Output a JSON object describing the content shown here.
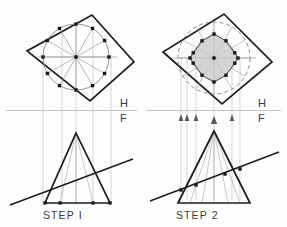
{
  "drawing": {
    "title": "Cone cut by oblique plane - two step construction",
    "background": "#fdfdfd",
    "colors": {
      "heavy_line": "#1c1c1c",
      "light_line": "#b4b4b4",
      "medium_line": "#8a8a8a",
      "fold_line": "#b9b9b9",
      "dot": "#1a1a1a",
      "shade_fill": "#c9c9c9",
      "label_text": "#3b3b3b"
    }
  },
  "panels": [
    {
      "id": "step1",
      "step_label": "STEP I",
      "step_label_pos": {
        "x": 43,
        "y": 219
      },
      "fold_labels": {
        "top": "H",
        "bottom": "F"
      },
      "fold_label_pos": {
        "h_x": 120,
        "h_y": 107,
        "f_x": 120,
        "f_y": 121
      },
      "fold_line": {
        "x1": 6,
        "y1": 110.5,
        "x2": 137,
        "y2": 110.5
      },
      "top_view": {
        "square_corners": [
          {
            "x": 92,
            "y": 15
          },
          {
            "x": 134,
            "y": 62
          },
          {
            "x": 90,
            "y": 101
          },
          {
            "x": 27,
            "y": 51
          }
        ],
        "circle_center": {
          "x": 76,
          "y": 57
        },
        "circle_radius": 33,
        "circle_style": "solid",
        "divisions": 12,
        "start_angle_deg": -90,
        "spokes_visible": true,
        "point_markers": 12,
        "marker_size": 3.4,
        "shaded": false
      },
      "front_view": {
        "apex": {
          "x": 76,
          "y": 133
        },
        "base_left": {
          "x": 45,
          "y": 203
        },
        "base_right": {
          "x": 110,
          "y": 203
        },
        "base_dots_x": [
          45,
          60,
          93,
          110
        ],
        "base_dot_y": 203,
        "element_lines": 6,
        "cut_line": {
          "x1": 10,
          "y1": 205,
          "x2": 133,
          "y2": 159
        },
        "cut_points": []
      },
      "projectors": {
        "from_top_x": [
          43,
          62,
          93,
          111
        ],
        "y_top": 60,
        "y_bottom": 205,
        "arrows": false
      }
    },
    {
      "id": "step2",
      "step_label": "STEP 2",
      "step_label_pos": {
        "x": 176,
        "y": 219
      },
      "fold_labels": {
        "top": "H",
        "bottom": "F"
      },
      "fold_label_pos": {
        "h_x": 258,
        "h_y": 107,
        "f_x": 258,
        "f_y": 121
      },
      "fold_line": {
        "x1": 146,
        "y1": 110.5,
        "x2": 281,
        "y2": 110.5
      },
      "top_view": {
        "square_corners": [
          {
            "x": 224,
            "y": 14
          },
          {
            "x": 272,
            "y": 62
          },
          {
            "x": 222,
            "y": 104
          },
          {
            "x": 163,
            "y": 52
          }
        ],
        "circle_center": {
          "x": 214,
          "y": 58
        },
        "circle_radius": 36,
        "circle_style": "dashed",
        "inner_radius": 24,
        "inner_style": "shaded-polygon",
        "divisions": 12,
        "start_angle_deg": -90,
        "spokes_visible": true,
        "point_markers": 12,
        "marker_size": 3.4,
        "shaded": true
      },
      "front_view": {
        "apex": {
          "x": 214,
          "y": 131
        },
        "base_left": {
          "x": 178,
          "y": 203
        },
        "base_right": {
          "x": 250,
          "y": 203
        },
        "base_dots_x": [],
        "base_dot_y": 203,
        "element_lines": 6,
        "cut_line": {
          "x1": 150,
          "y1": 201,
          "x2": 279,
          "y2": 152
        },
        "cut_points": [
          {
            "x": 181,
            "y": 190
          },
          {
            "x": 196,
            "y": 185
          },
          {
            "x": 225,
            "y": 174
          },
          {
            "x": 240,
            "y": 169
          }
        ]
      },
      "projectors": {
        "from_top_x": [
          181,
          187,
          196,
          214,
          232,
          240
        ],
        "y_top": 58,
        "y_bottom": 200,
        "arrows": true,
        "arrow_y": 119,
        "arrow_xs": [
          181,
          187,
          196,
          214,
          232,
          240
        ]
      }
    }
  ]
}
